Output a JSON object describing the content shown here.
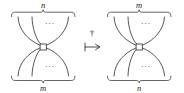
{
  "figure": {
    "kind": "string-diagram-dagger-map",
    "operator_symbol": "†",
    "mapsto_symbol": "↦",
    "ellipsis": "···",
    "left_diagram": {
      "name": "left-string-diagram",
      "top_label": "n",
      "bottom_label": "m",
      "top_ellipsis": "···",
      "bottom_ellipsis": "···",
      "node_shape": "square",
      "top_strand_count": 4,
      "bottom_strand_count": 4
    },
    "right_diagram": {
      "name": "right-string-diagram",
      "top_label": "m",
      "bottom_label": "n",
      "top_ellipsis": "···",
      "bottom_ellipsis": "···",
      "node_shape": "square",
      "top_strand_count": 4,
      "bottom_strand_count": 4
    },
    "colors": {
      "ink": "#1f1f1f",
      "background": "#ffffff",
      "node_fill": "#ffffff"
    }
  }
}
